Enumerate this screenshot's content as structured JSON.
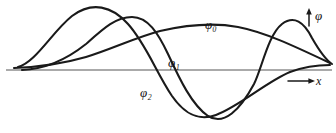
{
  "figure": {
    "background_color": "#ffffff",
    "curve_color": "#1a1a1a",
    "axis_color": "#8e8e8e",
    "width": 336,
    "height": 133
  },
  "axes": {
    "x_axis": {
      "label": "x",
      "arrow_symbol": "→",
      "baseline_y": 70,
      "start_x": 6,
      "end_x": 332
    },
    "y_axis": {
      "label": "φ",
      "arrow_symbol": "↑",
      "direction": "up",
      "position": "top-right"
    }
  },
  "labels": [
    {
      "id": "phi0",
      "base": "φ",
      "subscript": "0",
      "x": 205,
      "y": 18
    },
    {
      "id": "phi1",
      "base": "φ",
      "subscript": "1",
      "x": 168,
      "y": 56
    },
    {
      "id": "phi2",
      "base": "φ",
      "subscript": "2",
      "x": 140,
      "y": 86
    }
  ],
  "chart_data": {
    "type": "line",
    "title": "",
    "xlabel": "x",
    "ylabel": "φ",
    "grid": false,
    "legend": "inline-annotations",
    "axis_baseline_value": 0,
    "xlim": [
      0,
      336
    ],
    "ylim": [
      133,
      0
    ],
    "series": [
      {
        "name": "φ₀",
        "label": "φ₀",
        "description": "Broad single-lobe curve, entirely positive, rising slowly from the left and peaking near the right-centre before decaying toward the axis.",
        "path": "M 14,68 C 40,67 62,64 86,57 C 112,49 134,38 160,31 C 186,25 212,22 238,27 C 264,32 292,45 330,63",
        "points": [
          {
            "x": 14,
            "y": 68
          },
          {
            "x": 50,
            "y": 66
          },
          {
            "x": 86,
            "y": 57
          },
          {
            "x": 122,
            "y": 42
          },
          {
            "x": 160,
            "y": 31
          },
          {
            "x": 200,
            "y": 23
          },
          {
            "x": 238,
            "y": 27
          },
          {
            "x": 275,
            "y": 39
          },
          {
            "x": 305,
            "y": 51
          },
          {
            "x": 330,
            "y": 63
          }
        ]
      },
      {
        "name": "φ₁",
        "label": "φ₁",
        "description": "Single node curve: one positive hump on the left, crossing the axis near the middle, one deep negative trough, then rising back to the axis at the right.",
        "path": "M 18,67 C 36,62 52,32 72,16 C 92,1 112,6 128,24 C 146,44 156,72 172,96 C 186,116 200,121 216,115 C 240,106 266,82 290,72 C 306,66 320,65 330,65",
        "points": [
          {
            "x": 18,
            "y": 67
          },
          {
            "x": 45,
            "y": 40
          },
          {
            "x": 72,
            "y": 16
          },
          {
            "x": 100,
            "y": 12
          },
          {
            "x": 128,
            "y": 24
          },
          {
            "x": 150,
            "y": 52
          },
          {
            "x": 172,
            "y": 96
          },
          {
            "x": 195,
            "y": 118
          },
          {
            "x": 216,
            "y": 115
          },
          {
            "x": 250,
            "y": 97
          },
          {
            "x": 290,
            "y": 72
          },
          {
            "x": 330,
            "y": 65
          }
        ]
      },
      {
        "name": "φ₂",
        "label": "φ₂",
        "description": "Two node curve: positive hump left of centre, negative trough in the middle, second positive hump on the right, decaying at the far right edge.",
        "path": "M 22,70 C 46,69 66,60 86,44 C 104,28 116,17 132,17 C 148,17 158,33 168,54 C 180,80 192,105 208,116 C 224,126 240,110 254,84 C 262,68 268,35 282,24 C 294,15 304,22 312,38 C 320,52 326,60 332,64",
        "points": [
          {
            "x": 22,
            "y": 70
          },
          {
            "x": 55,
            "y": 64
          },
          {
            "x": 86,
            "y": 44
          },
          {
            "x": 112,
            "y": 21
          },
          {
            "x": 132,
            "y": 17
          },
          {
            "x": 155,
            "y": 36
          },
          {
            "x": 168,
            "y": 54
          },
          {
            "x": 188,
            "y": 98
          },
          {
            "x": 208,
            "y": 116
          },
          {
            "x": 232,
            "y": 104
          },
          {
            "x": 254,
            "y": 84
          },
          {
            "x": 268,
            "y": 40
          },
          {
            "x": 282,
            "y": 24
          },
          {
            "x": 300,
            "y": 27
          },
          {
            "x": 318,
            "y": 48
          },
          {
            "x": 332,
            "y": 64
          }
        ]
      }
    ]
  }
}
